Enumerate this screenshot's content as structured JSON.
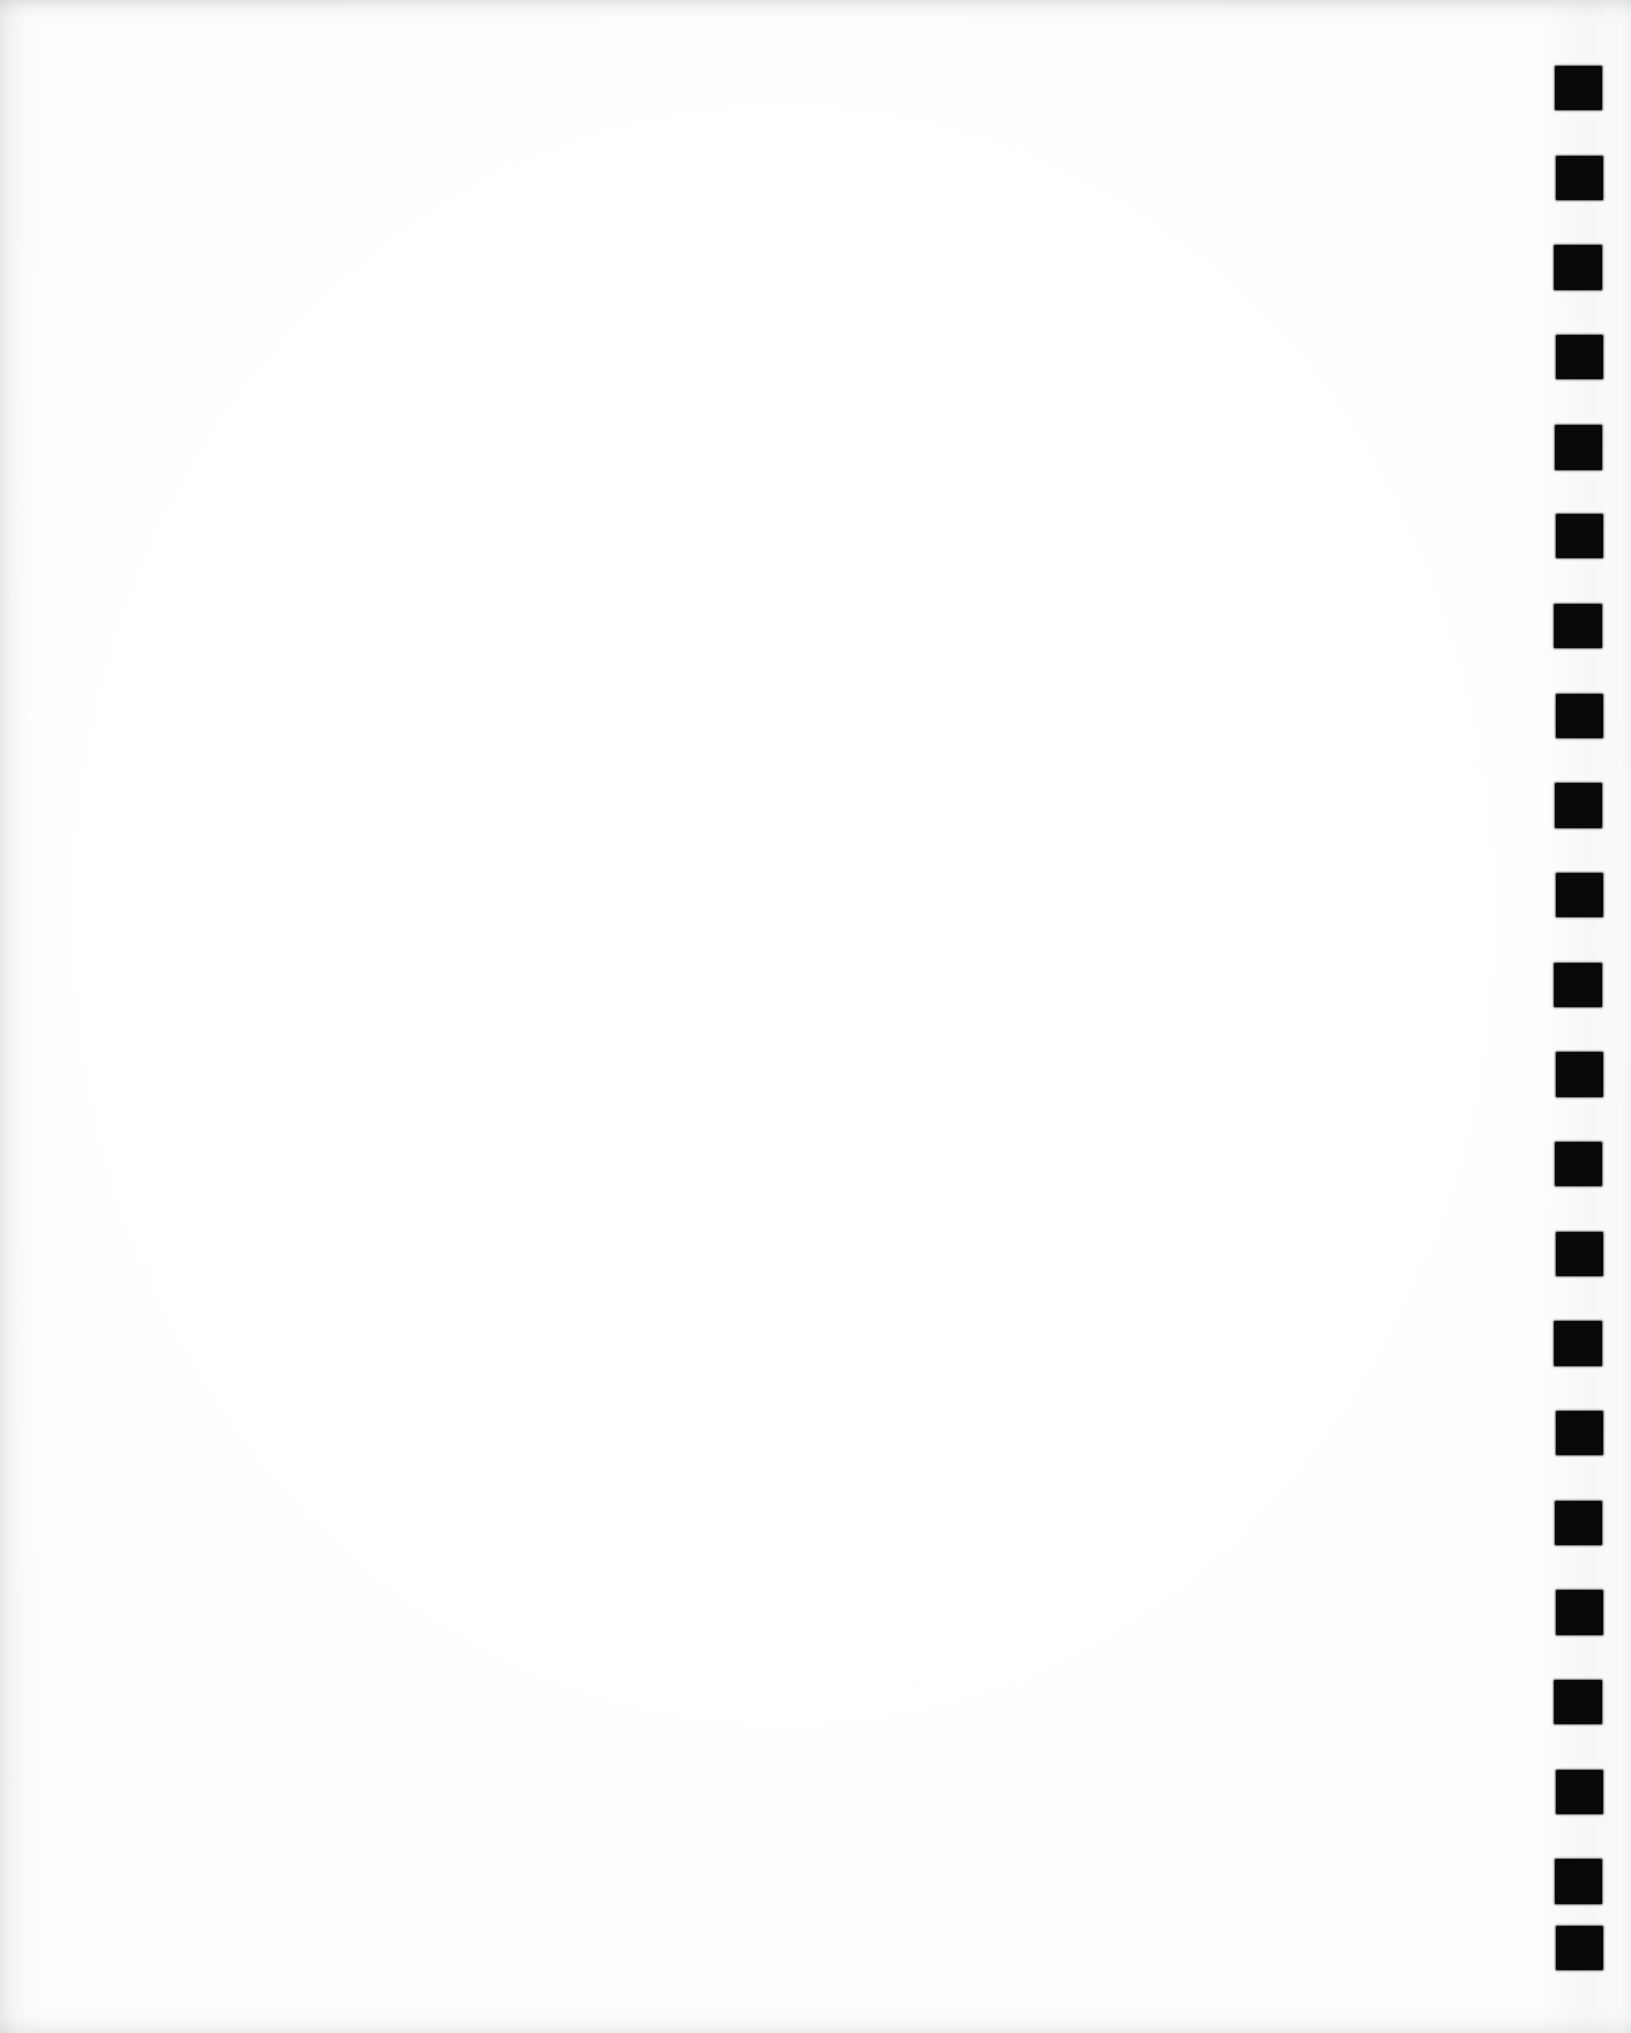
{
  "page": {
    "kind": "scanned-document-page",
    "width": 1631,
    "height": 2033,
    "background_color": "#fdfdfd",
    "paper_color": "#ffffff",
    "body_text": "",
    "visible_text": ""
  },
  "edges": {
    "top_band_color": "#b0b2b6",
    "left_band_color": "#b6b8bc",
    "bottom_band_color": "#bcbec2",
    "right_band_color": "#ced0d4",
    "gutter_color": "#e4e5e8"
  },
  "registration_strip": {
    "label": "registration-mark-column",
    "mark_color": "#080808",
    "mark_count": 22,
    "mark_width": 47,
    "mark_height": 44,
    "left_x": 1555,
    "pitch_y": 89.6,
    "first_mark_top_y": 66,
    "last_mark_bottom_y": 1970,
    "marks": [
      {
        "index": 1,
        "x": 1555,
        "y": 66,
        "w": 47,
        "h": 44
      },
      {
        "index": 2,
        "x": 1556,
        "y": 156,
        "w": 47,
        "h": 44
      },
      {
        "index": 3,
        "x": 1554,
        "y": 245,
        "w": 48,
        "h": 45
      },
      {
        "index": 4,
        "x": 1556,
        "y": 335,
        "w": 47,
        "h": 44
      },
      {
        "index": 5,
        "x": 1555,
        "y": 425,
        "w": 47,
        "h": 45
      },
      {
        "index": 6,
        "x": 1556,
        "y": 514,
        "w": 47,
        "h": 44
      },
      {
        "index": 7,
        "x": 1554,
        "y": 604,
        "w": 48,
        "h": 44
      },
      {
        "index": 8,
        "x": 1556,
        "y": 694,
        "w": 47,
        "h": 44
      },
      {
        "index": 9,
        "x": 1555,
        "y": 783,
        "w": 47,
        "h": 45
      },
      {
        "index": 10,
        "x": 1556,
        "y": 873,
        "w": 47,
        "h": 44
      },
      {
        "index": 11,
        "x": 1554,
        "y": 963,
        "w": 48,
        "h": 44
      },
      {
        "index": 12,
        "x": 1556,
        "y": 1052,
        "w": 47,
        "h": 45
      },
      {
        "index": 13,
        "x": 1555,
        "y": 1142,
        "w": 47,
        "h": 44
      },
      {
        "index": 14,
        "x": 1556,
        "y": 1232,
        "w": 47,
        "h": 44
      },
      {
        "index": 15,
        "x": 1554,
        "y": 1321,
        "w": 48,
        "h": 45
      },
      {
        "index": 16,
        "x": 1556,
        "y": 1411,
        "w": 47,
        "h": 44
      },
      {
        "index": 17,
        "x": 1555,
        "y": 1501,
        "w": 47,
        "h": 44
      },
      {
        "index": 18,
        "x": 1556,
        "y": 1590,
        "w": 47,
        "h": 45
      },
      {
        "index": 19,
        "x": 1554,
        "y": 1680,
        "w": 48,
        "h": 44
      },
      {
        "index": 20,
        "x": 1556,
        "y": 1770,
        "w": 47,
        "h": 44
      },
      {
        "index": 21,
        "x": 1555,
        "y": 1859,
        "w": 47,
        "h": 45
      },
      {
        "index": 22,
        "x": 1556,
        "y": 1926,
        "w": 47,
        "h": 44
      }
    ]
  }
}
